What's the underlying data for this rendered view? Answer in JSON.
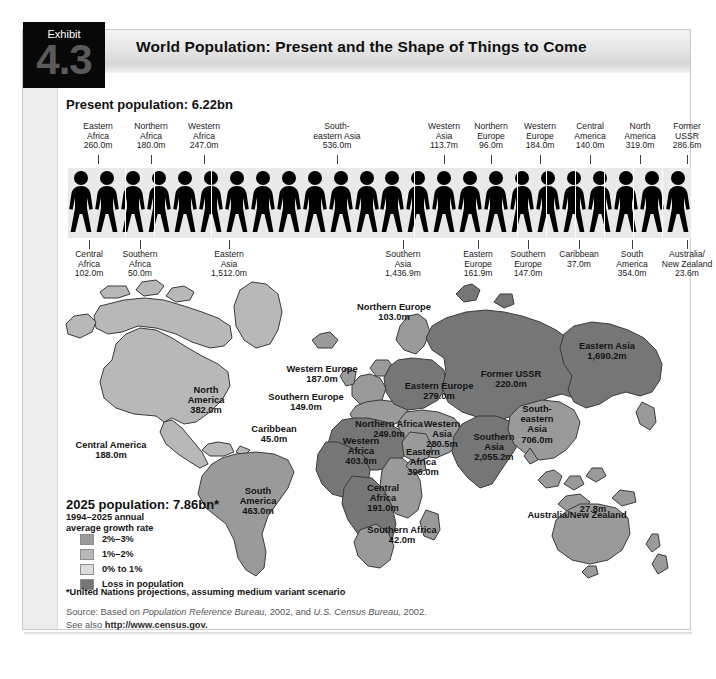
{
  "exhibit": {
    "word": "Exhibit",
    "number": "4.3"
  },
  "header": {
    "title": "World Population: Present and the Shape of Things to Come"
  },
  "present": {
    "title": "Present population: 6.22bn",
    "top_labels": [
      {
        "name": "Eastern\nAfrica",
        "value": "260.0m",
        "x": 72,
        "w": 52,
        "y": 122,
        "tick": 98
      },
      {
        "name": "Northern\nAfrica",
        "value": "180.0m",
        "x": 124,
        "w": 54,
        "y": 122,
        "tick": 151
      },
      {
        "name": "Western\nAfrica",
        "value": "247.0m",
        "x": 178,
        "w": 52,
        "y": 122,
        "tick": 204
      },
      {
        "name": "South-\neastern Asia",
        "value": "536.0m",
        "x": 296,
        "w": 82,
        "y": 122,
        "tick": 337
      },
      {
        "name": "Western\nAsia",
        "value": "113.7m",
        "x": 420,
        "w": 48,
        "y": 122,
        "tick": 444
      },
      {
        "name": "Northern\nEurope",
        "value": "96.0m",
        "x": 466,
        "w": 50,
        "y": 122,
        "tick": 491
      },
      {
        "name": "Western\nEurope",
        "value": "184.0m",
        "x": 514,
        "w": 52,
        "y": 122,
        "tick": 540
      },
      {
        "name": "Central\nAmerica",
        "value": "140.0m",
        "x": 564,
        "w": 52,
        "y": 122,
        "tick": 590
      },
      {
        "name": "North\nAmerica",
        "value": "319.0m",
        "x": 614,
        "w": 52,
        "y": 122,
        "tick": 640
      },
      {
        "name": "Former\nUSSR",
        "value": "286.6m",
        "x": 662,
        "w": 50,
        "y": 122,
        "tick": 687
      }
    ],
    "bottom_labels": [
      {
        "name": "Central\nAfrica",
        "value": "102.0m",
        "x": 63,
        "w": 52,
        "y": 250,
        "tick": 89
      },
      {
        "name": "Southern\nAfrica",
        "value": "50.0m",
        "x": 113,
        "w": 54,
        "y": 250,
        "tick": 140
      },
      {
        "name": "Eastern\nAsia",
        "value": "1,512.0m",
        "x": 196,
        "w": 66,
        "y": 250,
        "tick": 229
      },
      {
        "name": "Southern\nAsia",
        "value": "1,436.9m",
        "x": 370,
        "w": 66,
        "y": 250,
        "tick": 403
      },
      {
        "name": "Eastern\nEurope",
        "value": "161.9m",
        "x": 452,
        "w": 52,
        "y": 250,
        "tick": 478
      },
      {
        "name": "Southern\nEurope",
        "value": "147.0m",
        "x": 501,
        "w": 54,
        "y": 250,
        "tick": 528
      },
      {
        "name": "Caribbean",
        "value": "37.0m",
        "x": 552,
        "w": 54,
        "y": 250,
        "tick": 579
      },
      {
        "name": "South\nAmerica",
        "value": "354.0m",
        "x": 606,
        "w": 52,
        "y": 250,
        "tick": 632
      },
      {
        "name": "Australia/\nNew Zealand",
        "value": "23.6m",
        "x": 654,
        "w": 66,
        "y": 250,
        "tick": 687
      }
    ],
    "figure_count": 24,
    "divider_positions": [
      57,
      86,
      143,
      346,
      449,
      478,
      507,
      536,
      565,
      594
    ]
  },
  "map": {
    "regions": [
      {
        "name": "Northern Europe",
        "value": "103.0m",
        "x": 344,
        "y": 302,
        "w": 100,
        "tone": "mid"
      },
      {
        "name": "Western Europe",
        "value": "187.0m",
        "x": 274,
        "y": 364,
        "w": 96,
        "tone": "mid"
      },
      {
        "name": "Southern Europe",
        "value": "149.0m",
        "x": 254,
        "y": 392,
        "w": 104,
        "tone": "mid"
      },
      {
        "name": "Eastern Europe",
        "value": "279.0m",
        "x": 400,
        "y": 381,
        "w": 78,
        "tone": "dark"
      },
      {
        "name": "Former USSR",
        "value": "220.0m",
        "x": 468,
        "y": 369,
        "w": 86,
        "tone": "dark"
      },
      {
        "name": "Eastern Asia",
        "value": "1,690.2m",
        "x": 562,
        "y": 341,
        "w": 90,
        "tone": "dark"
      },
      {
        "name": "Western\nAsia",
        "value": "280.5m",
        "x": 414,
        "y": 419,
        "w": 56,
        "tone": "mid"
      },
      {
        "name": "South-\neastern\nAsia",
        "value": "706.0m",
        "x": 506,
        "y": 404,
        "w": 62,
        "tone": "mid"
      },
      {
        "name": "Southern\nAsia",
        "value": "2,055.2m",
        "x": 459,
        "y": 432,
        "w": 70,
        "tone": "dark"
      },
      {
        "name": "North\nAmerica",
        "value": "382.0m",
        "x": 170,
        "y": 385,
        "w": 72,
        "tone": "light"
      },
      {
        "name": "Central America",
        "value": "188.0m",
        "x": 60,
        "y": 440,
        "w": 102,
        "tone": "light"
      },
      {
        "name": "Caribbean",
        "value": "45.0m",
        "x": 238,
        "y": 424,
        "w": 72,
        "tone": "light"
      },
      {
        "name": "South\nAmerica",
        "value": "463.0m",
        "x": 226,
        "y": 486,
        "w": 64,
        "tone": "mid"
      },
      {
        "name": "Northern Africa",
        "value": "249.0m",
        "x": 340,
        "y": 419,
        "w": 98,
        "tone": "dark"
      },
      {
        "name": "Western\nAfrica",
        "value": "403.0m",
        "x": 330,
        "y": 436,
        "w": 62,
        "tone": "dark"
      },
      {
        "name": "Eastern\nAfrica",
        "value": "396.0m",
        "x": 392,
        "y": 447,
        "w": 62,
        "tone": "mid"
      },
      {
        "name": "Central\nAfrica",
        "value": "191.0m",
        "x": 352,
        "y": 483,
        "w": 62,
        "tone": "dark"
      },
      {
        "name": "Southern Africa",
        "value": "42.0m",
        "x": 352,
        "y": 525,
        "w": 100,
        "tone": "mid"
      },
      {
        "name": "Australia/New Zealand",
        "value": "27.8m",
        "x": 512,
        "y": 510,
        "w": 130,
        "tone": "mid"
      }
    ],
    "aus_value_label": {
      "text": "27.8m",
      "x": 568,
      "y": 504
    },
    "aus_name_label": {
      "text": "Australia/New Zealand",
      "x": 512,
      "y": 551
    }
  },
  "legend": {
    "title": "2025 population: 7.86bn*",
    "subtitle": "1994–2025 annual\naverage growth rate",
    "items": [
      {
        "label": "2%–3%",
        "color": "#9a9a9a",
        "y": 534
      },
      {
        "label": "1%–2%",
        "color": "#b8b8b8",
        "y": 549
      },
      {
        "label": "0% to 1%",
        "color": "#dcdcdc",
        "y": 564
      },
      {
        "label": "Loss in population",
        "color": "#767676",
        "y": 579
      }
    ]
  },
  "footnote": "*United Nations projections, assuming medium variant scenario",
  "source": {
    "line1_a": "Source: Based on ",
    "line1_b": "Population Reference Bureau,",
    "line1_c": " 2002, and ",
    "line1_d": "U.S. Census Bureau,",
    "line1_e": " 2002.",
    "line2_a": "See also ",
    "line2_b": "http://www.census.gov."
  },
  "colors": {
    "tone_dark": "#767676",
    "tone_mid": "#9a9a9a",
    "tone_light": "#b8b8b8",
    "outline": "#3a3a3a",
    "panel_bg": "#ffffff",
    "header_bg": "#e6e6e6",
    "exhibit_bg": "#080808"
  }
}
